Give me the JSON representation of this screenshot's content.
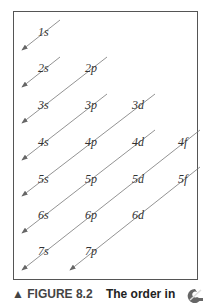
{
  "diagram": {
    "orbitals": [
      {
        "label": "1s",
        "x": 38,
        "y": 36
      },
      {
        "label": "2s",
        "x": 38,
        "y": 72
      },
      {
        "label": "2p",
        "x": 85,
        "y": 72
      },
      {
        "label": "3s",
        "x": 38,
        "y": 109
      },
      {
        "label": "3p",
        "x": 85,
        "y": 109
      },
      {
        "label": "3d",
        "x": 132,
        "y": 109
      },
      {
        "label": "4s",
        "x": 38,
        "y": 146
      },
      {
        "label": "4p",
        "x": 85,
        "y": 146
      },
      {
        "label": "4d",
        "x": 132,
        "y": 146
      },
      {
        "label": "4f",
        "x": 178,
        "y": 146
      },
      {
        "label": "5s",
        "x": 38,
        "y": 183
      },
      {
        "label": "5p",
        "x": 85,
        "y": 183
      },
      {
        "label": "5d",
        "x": 132,
        "y": 183
      },
      {
        "label": "5f",
        "x": 178,
        "y": 183
      },
      {
        "label": "6s",
        "x": 38,
        "y": 219
      },
      {
        "label": "6p",
        "x": 85,
        "y": 219
      },
      {
        "label": "6d",
        "x": 132,
        "y": 219
      },
      {
        "label": "7s",
        "x": 38,
        "y": 255
      },
      {
        "label": "7p",
        "x": 85,
        "y": 255
      }
    ],
    "arrows": [
      {
        "x1": 60,
        "y1": 20,
        "x2": 22,
        "y2": 50
      },
      {
        "x1": 60,
        "y1": 57,
        "x2": 22,
        "y2": 87
      },
      {
        "x1": 107,
        "y1": 57,
        "x2": 22,
        "y2": 123
      },
      {
        "x1": 107,
        "y1": 94,
        "x2": 22,
        "y2": 160
      },
      {
        "x1": 155,
        "y1": 94,
        "x2": 22,
        "y2": 196
      },
      {
        "x1": 155,
        "y1": 130,
        "x2": 22,
        "y2": 233
      },
      {
        "x1": 200,
        "y1": 130,
        "x2": 22,
        "y2": 270
      },
      {
        "x1": 200,
        "y1": 167,
        "x2": 70,
        "y2": 270
      }
    ]
  },
  "caption": {
    "figure_label": "▲ FIGURE 8.2",
    "text": "The order in"
  }
}
